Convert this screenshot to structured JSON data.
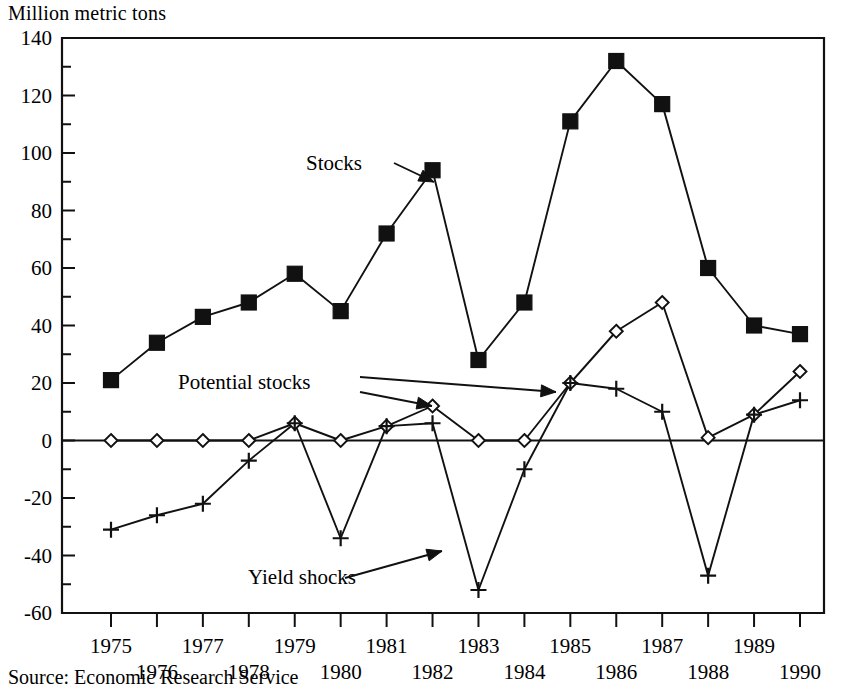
{
  "axis_title": "Million metric tons",
  "source_note": "Source: Economic Research Service",
  "annotations": {
    "stocks": "Stocks",
    "potential_stocks": "Potential stocks",
    "yield_shocks": "Yield shocks"
  },
  "colors": {
    "ink": "#111111",
    "background": "#ffffff"
  },
  "chart_data": {
    "type": "line",
    "title": "",
    "subtitle": "",
    "xlabel": "",
    "ylabel": "Million metric tons",
    "ylim": [
      -60,
      140
    ],
    "ytick_step": 20,
    "yminor_step": 10,
    "grid": false,
    "legend": "none",
    "legend_position": "inline-annotations",
    "source": "Source: Economic Research Service",
    "x": [
      1975,
      1976,
      1977,
      1978,
      1979,
      1980,
      1981,
      1982,
      1983,
      1984,
      1985,
      1986,
      1987,
      1988,
      1989,
      1990
    ],
    "xtick_labels": [
      "1975",
      "1976",
      "1977",
      "1978",
      "1979",
      "1980",
      "1981",
      "1982",
      "1983",
      "1984",
      "1985",
      "1986",
      "1987",
      "1988",
      "1989",
      "1990"
    ],
    "ytick_labels": [
      "140",
      "120",
      "100",
      "80",
      "60",
      "40",
      "20",
      "0",
      "-20",
      "-40",
      "-60"
    ],
    "ytick_values": [
      140,
      120,
      100,
      80,
      60,
      40,
      20,
      0,
      -20,
      -40,
      -60
    ],
    "series": [
      {
        "name": "Stocks",
        "marker": "filled-square",
        "values": [
          21,
          34,
          43,
          48,
          58,
          45,
          72,
          94,
          28,
          48,
          111,
          132,
          117,
          60,
          40,
          37
        ]
      },
      {
        "name": "Potential stocks",
        "marker": "open-diamond",
        "values": [
          0,
          0,
          0,
          0,
          6,
          0,
          5,
          12,
          0,
          0,
          20,
          38,
          48,
          1,
          9,
          24
        ]
      },
      {
        "name": "Yield shocks",
        "marker": "plus",
        "values": [
          -31,
          -26,
          -22,
          -7,
          6,
          -34,
          5,
          6,
          -52,
          -10,
          20,
          18,
          10,
          -47,
          9,
          14
        ]
      }
    ],
    "annotations": [
      {
        "text": "Stocks",
        "points_to_year": 1982,
        "points_to_value": 94
      },
      {
        "text": "Potential stocks",
        "points_to_year": 1982,
        "points_to_value": 12
      },
      {
        "text": "Potential stocks",
        "points_to_year": 1985,
        "points_to_value": 20
      },
      {
        "text": "Yield shocks",
        "points_to_year": 1983,
        "points_to_value": -52
      }
    ]
  }
}
